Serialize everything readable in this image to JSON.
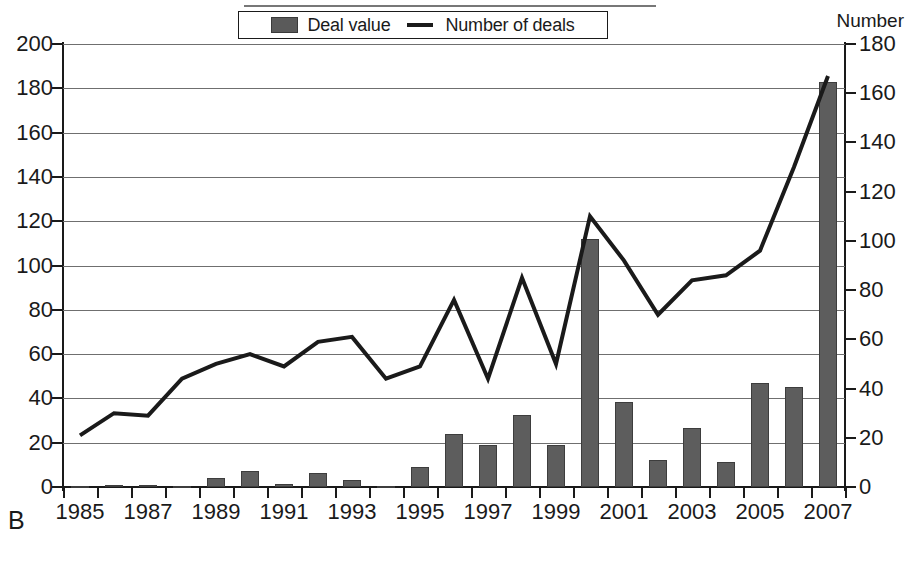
{
  "panel_label": "B",
  "axis_right_title": "Number",
  "legend": {
    "bar_label": "Deal value",
    "line_label": "Number of deals",
    "bar_color": "#5d5d5d",
    "line_color": "#1a1a1a"
  },
  "chart_data": {
    "type": "bar",
    "title": "",
    "subtitle": "",
    "xlabel": "",
    "ylabel": "",
    "ylabel_right": "Number",
    "grid": true,
    "legend_position": "top-center",
    "ylim": [
      0,
      200
    ],
    "ylim_right": [
      0,
      180
    ],
    "ytick_step": 20,
    "ytick_step_right": 20,
    "yticks": [
      0,
      20,
      40,
      60,
      80,
      100,
      120,
      140,
      160,
      180,
      200
    ],
    "yticks_right": [
      0,
      20,
      40,
      60,
      80,
      100,
      120,
      140,
      160,
      180
    ],
    "x": [
      1985,
      1986,
      1987,
      1988,
      1989,
      1990,
      1991,
      1992,
      1993,
      1994,
      1995,
      1996,
      1997,
      1998,
      1999,
      2000,
      2001,
      2002,
      2003,
      2004,
      2005,
      2006,
      2007
    ],
    "xtick_labels": [
      "1985",
      "",
      "1987",
      "",
      "1989",
      "",
      "1991",
      "",
      "1993",
      "",
      "1995",
      "",
      "1997",
      "",
      "1999",
      "",
      "2001",
      "",
      "2003",
      "",
      "2005",
      "",
      "2007"
    ],
    "categories": [
      "1985",
      "1986",
      "1987",
      "1988",
      "1989",
      "1990",
      "1991",
      "1992",
      "1993",
      "1994",
      "1995",
      "1996",
      "1997",
      "1998",
      "1999",
      "2000",
      "2001",
      "2002",
      "2003",
      "2004",
      "2005",
      "2006",
      "2007"
    ],
    "series": [
      {
        "name": "Deal value",
        "type": "bar",
        "axis": "left",
        "values": [
          0.2,
          0.7,
          0.7,
          0.3,
          4,
          7,
          1.5,
          6.5,
          3,
          0.4,
          9,
          24,
          19,
          32.5,
          19,
          112,
          38.5,
          12,
          26.5,
          11.5,
          47,
          45,
          183
        ]
      },
      {
        "name": "Number of deals",
        "type": "line",
        "axis": "right",
        "values": [
          21,
          30,
          29,
          44,
          50,
          54,
          49,
          59,
          61,
          44,
          49,
          76,
          44,
          85,
          50,
          110,
          92,
          70,
          84,
          86,
          96,
          130,
          167
        ]
      }
    ]
  }
}
